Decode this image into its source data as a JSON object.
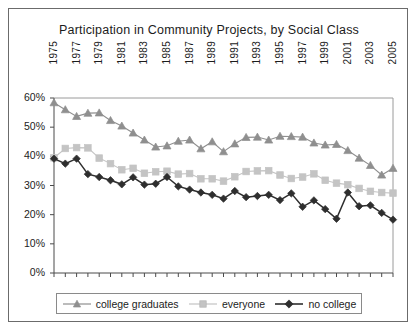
{
  "chart_data": {
    "type": "line",
    "title": "Participation in Community Projects, by Social Class",
    "xlabel": "",
    "ylabel": "",
    "ylim": [
      0,
      60
    ],
    "ytick_labels": [
      "0%",
      "10%",
      "20%",
      "30%",
      "40%",
      "50%",
      "60%"
    ],
    "ytick_values": [
      0,
      10,
      20,
      30,
      40,
      50,
      60
    ],
    "grid": false,
    "legend_position": "bottom",
    "x": [
      1975,
      1976,
      1977,
      1978,
      1979,
      1980,
      1981,
      1982,
      1983,
      1984,
      1985,
      1986,
      1987,
      1988,
      1989,
      1990,
      1991,
      1992,
      1993,
      1994,
      1995,
      1996,
      1997,
      1998,
      1999,
      2000,
      2001,
      2002,
      2003,
      2004,
      2005
    ],
    "xtick_labels": [
      "1975",
      "1977",
      "1979",
      "1981",
      "1983",
      "1985",
      "1987",
      "1989",
      "1991",
      "1993",
      "1995",
      "1997",
      "1999",
      "2001",
      "2003",
      "2005"
    ],
    "xtick_values": [
      1975,
      1977,
      1979,
      1981,
      1983,
      1985,
      1987,
      1989,
      1991,
      1993,
      1995,
      1997,
      1999,
      2001,
      2003,
      2005
    ],
    "series": [
      {
        "name": "college graduates",
        "marker": "triangle",
        "color": "#8f8f8f",
        "values": [
          58.4,
          56.0,
          53.7,
          54.8,
          54.9,
          52.3,
          50.4,
          48.0,
          45.6,
          43.2,
          43.6,
          45.2,
          45.6,
          42.6,
          45.0,
          41.6,
          44.3,
          46.5,
          46.6,
          45.6,
          46.9,
          46.8,
          46.6,
          44.6,
          43.9,
          44.1,
          42.0,
          39.4,
          36.9,
          33.6,
          35.9
        ]
      },
      {
        "name": "everyone",
        "marker": "square",
        "color": "#c4c4c4",
        "values": [
          39.5,
          42.7,
          43.0,
          42.9,
          39.4,
          37.5,
          35.4,
          35.9,
          34.2,
          34.7,
          34.9,
          33.9,
          34.1,
          32.3,
          32.3,
          31.5,
          33.0,
          34.8,
          35.0,
          35.1,
          33.6,
          32.4,
          32.9,
          34.0,
          31.8,
          30.8,
          30.3,
          29.0,
          28.0,
          27.6,
          27.4
        ]
      },
      {
        "name": "no college",
        "marker": "diamond",
        "color": "#2e2e2e",
        "values": [
          39.2,
          37.5,
          39.2,
          33.9,
          32.9,
          31.8,
          30.4,
          32.8,
          30.3,
          30.6,
          32.9,
          29.7,
          28.6,
          27.6,
          26.8,
          25.5,
          28.1,
          26.0,
          26.4,
          26.8,
          25.0,
          27.3,
          22.7,
          24.9,
          21.9,
          18.6,
          27.6,
          22.9,
          23.2,
          20.6,
          18.3
        ]
      }
    ]
  },
  "legend": {
    "items": [
      {
        "label": "college graduates"
      },
      {
        "label": "everyone"
      },
      {
        "label": "no college"
      }
    ]
  }
}
